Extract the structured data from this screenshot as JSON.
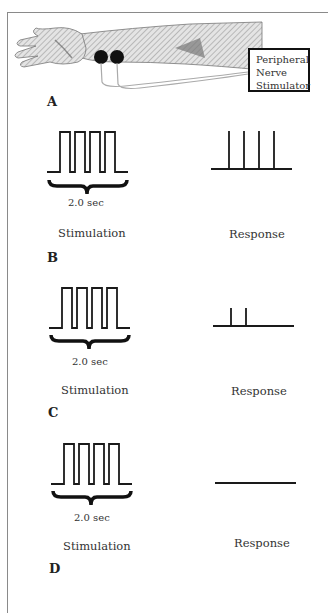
{
  "figure": {
    "device_label_lines": [
      "Peripheral",
      "Nerve",
      "Stimulator"
    ],
    "panels": [
      {
        "letter": "A",
        "content": "arm-with-electrodes"
      },
      {
        "letter": "B",
        "stim_pulses": 4,
        "response_twitches": 4,
        "duration": "2.0 sec",
        "stim_label": "Stimulation",
        "response_label": "Response"
      },
      {
        "letter": "C",
        "stim_pulses": 4,
        "response_twitches": 2,
        "duration": "2.0 sec",
        "stim_label": "Stimulation",
        "response_label": "Response"
      },
      {
        "letter": "D",
        "stim_pulses": 4,
        "response_twitches": 0,
        "duration": "2.0 sec",
        "stim_label": "Stimulation",
        "response_label": "Response"
      }
    ]
  },
  "colors": {
    "line": "#1a1a1a",
    "border": "#8a8a8a",
    "arm_fill": "#d8d8d8",
    "electrode": "#111111"
  }
}
